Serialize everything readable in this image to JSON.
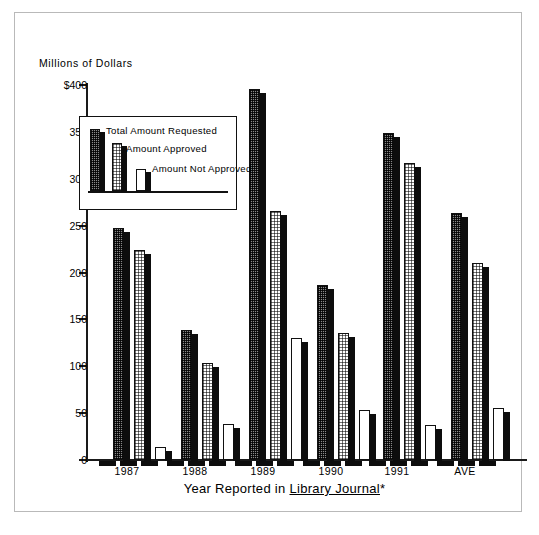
{
  "figure": {
    "y_axis_title": "Millions of Dollars",
    "x_axis_caption_prefix": "Year Reported in ",
    "x_axis_caption_source": "Library  Journal",
    "x_axis_caption_suffix": "*"
  },
  "legend": {
    "items": [
      {
        "label": "Total Amount Requested",
        "key": "requested",
        "swatch": "dark-checkered"
      },
      {
        "label": "Amount Approved",
        "key": "approved",
        "swatch": "light-grid"
      },
      {
        "label": "Amount Not Approved",
        "key": "not_approved",
        "swatch": "white-hollow"
      }
    ]
  },
  "chart_data": {
    "type": "bar",
    "title": "",
    "xlabel": "Year Reported in Library Journal*",
    "ylabel": "Millions of Dollars",
    "ylim": [
      0,
      400
    ],
    "yticks": [
      0,
      50,
      100,
      150,
      200,
      250,
      300,
      350,
      400
    ],
    "ytick_labels": [
      "0",
      "50",
      "100",
      "150",
      "200",
      "250",
      "300",
      "350",
      "$400"
    ],
    "grid": false,
    "legend_position": "upper-left-inset",
    "categories": [
      "1987",
      "1988",
      "1989",
      "1990",
      "1991",
      "AVE"
    ],
    "series": [
      {
        "name": "Total Amount Requested",
        "values": [
          247,
          139,
          396,
          187,
          349,
          264
        ]
      },
      {
        "name": "Amount Approved",
        "values": [
          224,
          103,
          266,
          135,
          317,
          210
        ]
      },
      {
        "name": "Amount Not Approved",
        "values": [
          14,
          38,
          130,
          53,
          37,
          55
        ]
      }
    ]
  },
  "colors": {
    "ink": "#111111",
    "shadow": "#0d0d0d",
    "frame": "#b9b9b9",
    "paper": "#ffffff"
  }
}
